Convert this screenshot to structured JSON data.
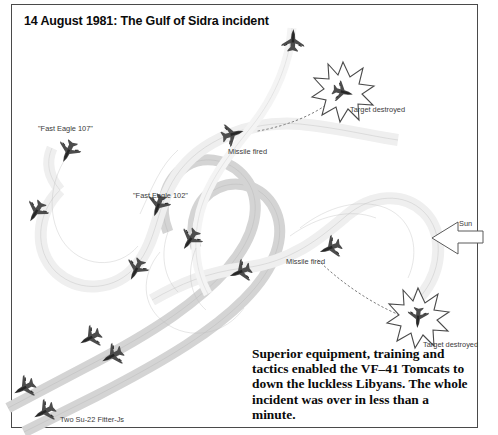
{
  "figure": {
    "title": "14 August 1981: The Gulf of Sidra incident",
    "caption": "Superior equipment, training and tactics enabled the VF–41 Tomcats to down the luckless Libyans. The whole incident was over in less than a minute.",
    "border_color": "#4a4a4a",
    "background_color": "#ffffff"
  },
  "labels": {
    "fast_eagle_107": "\"Fast Eagle 107\"",
    "fast_eagle_102": "\"Fast Eagle 102\"",
    "missile_fired_upper": "Missile fired",
    "missile_fired_lower": "Missile fired",
    "target_destroyed_upper": "Target destroyed",
    "target_destroyed_lower": "Target destroyed",
    "sun": "Sun",
    "su22": "Two Su-22 Fitter-Js"
  },
  "colors": {
    "tomcat_path": "#f2f2f2",
    "su22_path": "#d9d9d9",
    "path_outline": "#9a9a9a",
    "aircraft": "#4c4c4c",
    "aircraft_dark": "#333333",
    "missile_trail": "#6e6e6e",
    "text": "#3a3a3a",
    "title_text": "#0b0b0b"
  },
  "elements": {
    "aircraft_count": 13,
    "explosion_count": 2,
    "missile_trail_count": 2,
    "sun_arrow_direction": "left"
  }
}
